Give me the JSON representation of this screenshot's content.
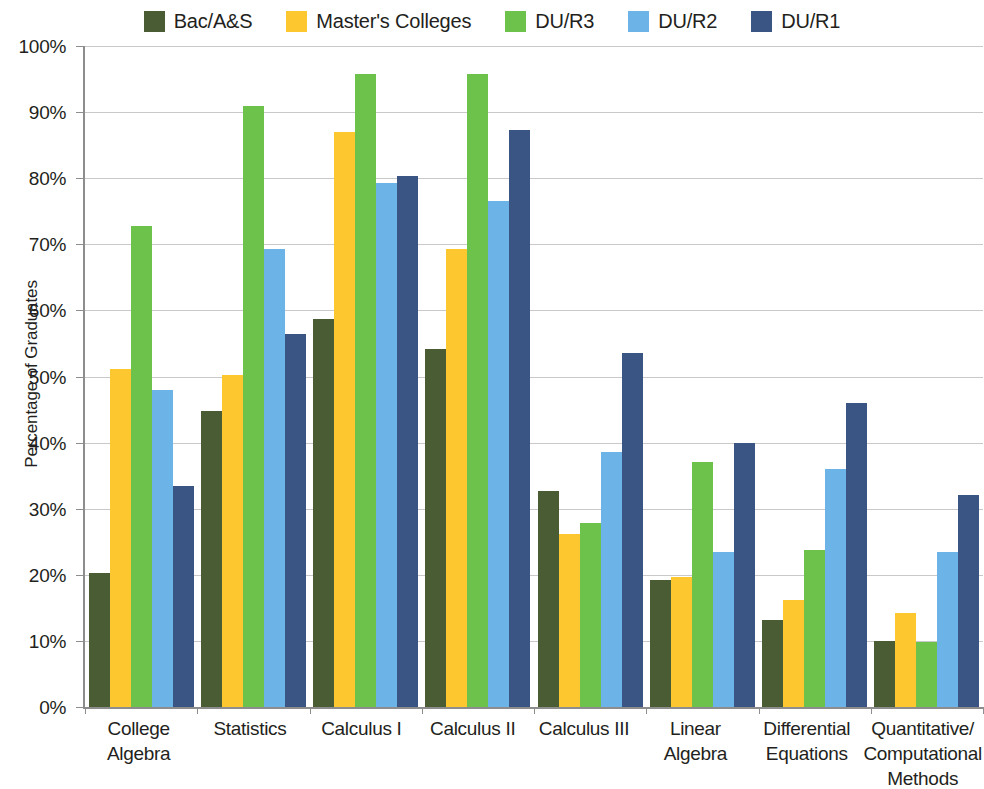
{
  "chart_data": {
    "type": "bar",
    "title": "",
    "subtitle": "",
    "xlabel": "",
    "ylabel": "Percentage of Graduates",
    "ylim": [
      0,
      100
    ],
    "ytick_labels": [
      "100%",
      "90%",
      "80%",
      "70%",
      "60%",
      "50%",
      "40%",
      "30%",
      "20%",
      "10%",
      "0%"
    ],
    "ytick_values": [
      100,
      90,
      80,
      70,
      60,
      50,
      40,
      30,
      20,
      10,
      0
    ],
    "grid": "horizontal",
    "legend_position": "top",
    "categories": [
      "College Algebra",
      "Statistics",
      "Calculus I",
      "Calculus II",
      "Calculus III",
      "Linear Algebra",
      "Differential Equations",
      "Quantitative/Computational Methods"
    ],
    "category_lines": [
      [
        "College",
        "Algebra"
      ],
      [
        "Statistics"
      ],
      [
        "Calculus I"
      ],
      [
        "Calculus II"
      ],
      [
        "Calculus III"
      ],
      [
        "Linear",
        "Algebra"
      ],
      [
        "Differential",
        "Equations"
      ],
      [
        "Quantitative/",
        "Computational",
        "Methods"
      ]
    ],
    "series": [
      {
        "name": "Bac/A&S",
        "color": "#4a5c33",
        "values": [
          20.2,
          44.8,
          58.7,
          54.2,
          32.7,
          19.2,
          13.1,
          10.0
        ]
      },
      {
        "name": "Master's Colleges",
        "color": "#fdc82f",
        "values": [
          51.2,
          50.2,
          87.0,
          69.3,
          26.2,
          19.7,
          16.2,
          14.2
        ]
      },
      {
        "name": "DU/R3",
        "color": "#6cc24a",
        "values": [
          72.8,
          91.0,
          95.7,
          95.8,
          27.8,
          37.0,
          23.7,
          9.9
        ]
      },
      {
        "name": "DU/R2",
        "color": "#6cb4e8",
        "values": [
          48.0,
          69.3,
          79.3,
          76.5,
          38.6,
          23.4,
          36.0,
          23.5
        ]
      },
      {
        "name": "DU/R1",
        "color": "#3a5584",
        "values": [
          33.5,
          56.4,
          80.4,
          87.3,
          53.5,
          40.0,
          46.0,
          32.1
        ]
      }
    ]
  },
  "axis": {
    "y_title": "Percentage of Graduates"
  },
  "colors": {
    "grid": "#c9c9c9",
    "axis": "#8d8d8d",
    "text": "#231f20",
    "background": "#ffffff"
  }
}
